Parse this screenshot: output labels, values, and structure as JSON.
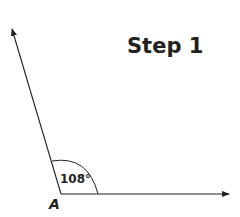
{
  "title": "Step 1",
  "angle": {
    "measure_label": "108°",
    "degrees": 108,
    "vertex_label": "A"
  },
  "colors": {
    "stroke": "#231f20",
    "background": "#ffffff"
  }
}
